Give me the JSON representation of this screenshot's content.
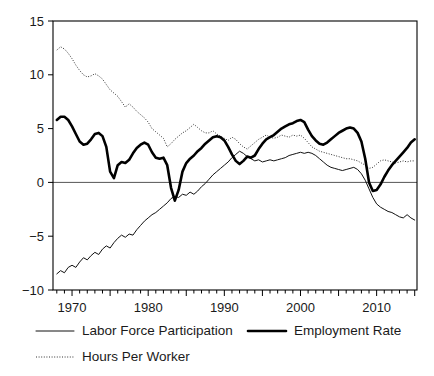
{
  "chart_data": {
    "type": "line",
    "title": "",
    "subtitle": "",
    "xlabel": "",
    "ylabel": "",
    "xlim": [
      1967.5,
      2015.3
    ],
    "ylim": [
      -10,
      15
    ],
    "grid": false,
    "legend_position": "bottom",
    "y_ticks": [
      15,
      10,
      5,
      0,
      -5,
      -10
    ],
    "y_tick_labels": [
      "15",
      "10",
      "5",
      "0",
      "−5",
      "−10"
    ],
    "x_ticks": [
      1970,
      1980,
      1990,
      2000,
      2010
    ],
    "x_tick_labels": [
      "1970",
      "1980",
      "1990",
      "2000",
      "2010"
    ],
    "x_minor_tick_interval": 1,
    "zero_reference_line": 0,
    "series": [
      {
        "name": "Labor Force Participation",
        "style": "solid-thin",
        "color": "#111111",
        "x": [
          1968.0,
          1968.5,
          1969.0,
          1969.5,
          1970.0,
          1970.5,
          1971.0,
          1971.5,
          1972.0,
          1972.5,
          1973.0,
          1973.5,
          1974.0,
          1974.5,
          1975.0,
          1975.5,
          1976.0,
          1976.5,
          1977.0,
          1977.5,
          1978.0,
          1978.5,
          1979.0,
          1979.5,
          1980.0,
          1980.5,
          1981.0,
          1981.5,
          1982.0,
          1982.5,
          1983.0,
          1983.5,
          1984.0,
          1984.5,
          1985.0,
          1985.5,
          1986.0,
          1986.5,
          1987.0,
          1987.5,
          1988.0,
          1988.5,
          1989.0,
          1989.5,
          1990.0,
          1990.5,
          1991.0,
          1991.5,
          1992.0,
          1992.5,
          1993.0,
          1993.5,
          1994.0,
          1994.5,
          1995.0,
          1995.5,
          1996.0,
          1996.5,
          1997.0,
          1997.5,
          1998.0,
          1998.5,
          1999.0,
          1999.5,
          2000.0,
          2000.5,
          2001.0,
          2001.5,
          2002.0,
          2002.5,
          2003.0,
          2003.5,
          2004.0,
          2004.5,
          2005.0,
          2005.5,
          2006.0,
          2006.5,
          2007.0,
          2007.5,
          2008.0,
          2008.5,
          2009.0,
          2009.5,
          2010.0,
          2010.5,
          2011.0,
          2011.5,
          2012.0,
          2012.5,
          2013.0,
          2013.5,
          2014.0,
          2014.5,
          2015.0
        ],
        "y": [
          -8.5,
          -8.2,
          -8.4,
          -7.9,
          -7.7,
          -7.9,
          -7.4,
          -7.0,
          -7.2,
          -6.8,
          -6.5,
          -6.7,
          -6.2,
          -5.9,
          -6.1,
          -5.6,
          -5.2,
          -4.9,
          -5.1,
          -4.8,
          -4.9,
          -4.4,
          -4.0,
          -3.6,
          -3.3,
          -3.0,
          -2.8,
          -2.5,
          -2.2,
          -1.9,
          -1.5,
          -1.3,
          -1.4,
          -1.1,
          -1.2,
          -0.9,
          -1.1,
          -0.8,
          -0.4,
          -0.1,
          0.3,
          0.7,
          1.0,
          1.3,
          1.6,
          1.9,
          2.3,
          2.6,
          2.9,
          2.7,
          2.4,
          2.2,
          2.0,
          2.1,
          1.9,
          2.0,
          2.1,
          2.0,
          2.1,
          2.2,
          2.3,
          2.5,
          2.6,
          2.7,
          2.8,
          2.7,
          2.8,
          2.7,
          2.5,
          2.2,
          1.9,
          1.6,
          1.4,
          1.3,
          1.2,
          1.1,
          1.2,
          1.3,
          1.4,
          1.2,
          0.8,
          0.2,
          -0.6,
          -1.4,
          -2.0,
          -2.3,
          -2.5,
          -2.7,
          -2.8,
          -3.0,
          -3.2,
          -3.3,
          -3.0,
          -3.3,
          -3.5
        ],
        "legend_index": 0
      },
      {
        "name": "Employment Rate",
        "style": "solid-thick",
        "color": "#000000",
        "x": [
          1968.0,
          1968.5,
          1969.0,
          1969.5,
          1970.0,
          1970.5,
          1971.0,
          1971.5,
          1972.0,
          1972.5,
          1973.0,
          1973.5,
          1974.0,
          1974.5,
          1975.0,
          1975.5,
          1976.0,
          1976.5,
          1977.0,
          1977.5,
          1978.0,
          1978.5,
          1979.0,
          1979.5,
          1980.0,
          1980.5,
          1981.0,
          1981.5,
          1982.0,
          1982.5,
          1983.0,
          1983.5,
          1984.0,
          1984.5,
          1985.0,
          1985.5,
          1986.0,
          1986.5,
          1987.0,
          1987.5,
          1988.0,
          1988.5,
          1989.0,
          1989.5,
          1990.0,
          1990.5,
          1991.0,
          1991.5,
          1992.0,
          1992.5,
          1993.0,
          1993.5,
          1994.0,
          1994.5,
          1995.0,
          1995.5,
          1996.0,
          1996.5,
          1997.0,
          1997.5,
          1998.0,
          1998.5,
          1999.0,
          1999.5,
          2000.0,
          2000.5,
          2001.0,
          2001.5,
          2002.0,
          2002.5,
          2003.0,
          2003.5,
          2004.0,
          2004.5,
          2005.0,
          2005.5,
          2006.0,
          2006.5,
          2007.0,
          2007.5,
          2008.0,
          2008.5,
          2009.0,
          2009.5,
          2010.0,
          2010.5,
          2011.0,
          2011.5,
          2012.0,
          2012.5,
          2013.0,
          2013.5,
          2014.0,
          2014.5,
          2015.0
        ],
        "y": [
          5.8,
          6.1,
          6.1,
          5.8,
          5.2,
          4.5,
          3.8,
          3.5,
          3.6,
          4.0,
          4.5,
          4.6,
          4.3,
          3.3,
          1.0,
          0.4,
          1.6,
          1.9,
          1.8,
          2.1,
          2.7,
          3.2,
          3.5,
          3.7,
          3.5,
          2.8,
          2.3,
          2.2,
          2.3,
          1.6,
          -0.5,
          -1.7,
          -0.7,
          1.0,
          1.8,
          2.2,
          2.5,
          2.9,
          3.2,
          3.6,
          3.9,
          4.2,
          4.3,
          4.2,
          3.9,
          3.3,
          2.6,
          2.0,
          1.7,
          2.0,
          2.4,
          2.3,
          2.5,
          3.1,
          3.6,
          4.0,
          4.2,
          4.4,
          4.7,
          5.0,
          5.2,
          5.4,
          5.5,
          5.7,
          5.8,
          5.6,
          4.9,
          4.3,
          3.9,
          3.6,
          3.5,
          3.7,
          4.0,
          4.3,
          4.6,
          4.8,
          5.0,
          5.1,
          5.0,
          4.6,
          3.8,
          2.2,
          0.0,
          -0.8,
          -0.7,
          -0.2,
          0.5,
          1.1,
          1.6,
          2.0,
          2.4,
          2.8,
          3.2,
          3.7,
          4.0
        ],
        "legend_index": 1
      },
      {
        "name": "Hours Per Worker",
        "style": "dotted",
        "color": "#333333",
        "x": [
          1968.0,
          1968.5,
          1969.0,
          1969.5,
          1970.0,
          1970.5,
          1971.0,
          1971.5,
          1972.0,
          1972.5,
          1973.0,
          1973.5,
          1974.0,
          1974.5,
          1975.0,
          1975.5,
          1976.0,
          1976.5,
          1977.0,
          1977.5,
          1978.0,
          1978.5,
          1979.0,
          1979.5,
          1980.0,
          1980.5,
          1981.0,
          1981.5,
          1982.0,
          1982.5,
          1983.0,
          1983.5,
          1984.0,
          1984.5,
          1985.0,
          1985.5,
          1986.0,
          1986.5,
          1987.0,
          1987.5,
          1988.0,
          1988.5,
          1989.0,
          1989.5,
          1990.0,
          1990.5,
          1991.0,
          1991.5,
          1992.0,
          1992.5,
          1993.0,
          1993.5,
          1994.0,
          1994.5,
          1995.0,
          1995.5,
          1996.0,
          1996.5,
          1997.0,
          1997.5,
          1998.0,
          1998.5,
          1999.0,
          1999.5,
          2000.0,
          2000.5,
          2001.0,
          2001.5,
          2002.0,
          2002.5,
          2003.0,
          2003.5,
          2004.0,
          2004.5,
          2005.0,
          2005.5,
          2006.0,
          2006.5,
          2007.0,
          2007.5,
          2008.0,
          2008.5,
          2009.0,
          2009.5,
          2010.0,
          2010.5,
          2011.0,
          2011.5,
          2012.0,
          2012.5,
          2013.0,
          2013.5,
          2014.0,
          2014.5,
          2015.0
        ],
        "y": [
          12.3,
          12.6,
          12.4,
          12.0,
          11.5,
          10.9,
          10.4,
          10.0,
          9.8,
          9.9,
          10.1,
          9.9,
          9.6,
          9.1,
          8.6,
          8.3,
          8.0,
          7.5,
          7.0,
          7.3,
          7.0,
          6.6,
          6.3,
          6.0,
          5.6,
          5.0,
          4.7,
          4.4,
          4.1,
          3.3,
          3.6,
          4.0,
          4.3,
          4.6,
          4.8,
          5.1,
          5.4,
          5.1,
          4.8,
          4.6,
          4.6,
          4.8,
          4.5,
          4.3,
          4.1,
          3.9,
          4.2,
          4.0,
          3.6,
          3.3,
          3.1,
          3.4,
          3.7,
          4.0,
          4.2,
          4.4,
          4.2,
          4.1,
          4.2,
          4.4,
          4.3,
          4.2,
          4.4,
          4.3,
          4.4,
          4.1,
          3.7,
          3.3,
          3.1,
          2.9,
          2.8,
          2.7,
          2.6,
          2.5,
          2.4,
          2.3,
          2.2,
          2.2,
          2.1,
          2.0,
          1.8,
          1.6,
          1.3,
          1.4,
          1.7,
          2.0,
          2.1,
          2.0,
          1.9,
          1.8,
          1.9,
          2.0,
          1.9,
          2.0,
          2.0
        ],
        "legend_index": 2
      }
    ]
  },
  "legend": {
    "items": [
      {
        "label": "Labor Force Participation",
        "style": "solid-thin"
      },
      {
        "label": "Employment Rate",
        "style": "solid-thick"
      },
      {
        "label": "Hours Per Worker",
        "style": "dotted"
      }
    ]
  }
}
